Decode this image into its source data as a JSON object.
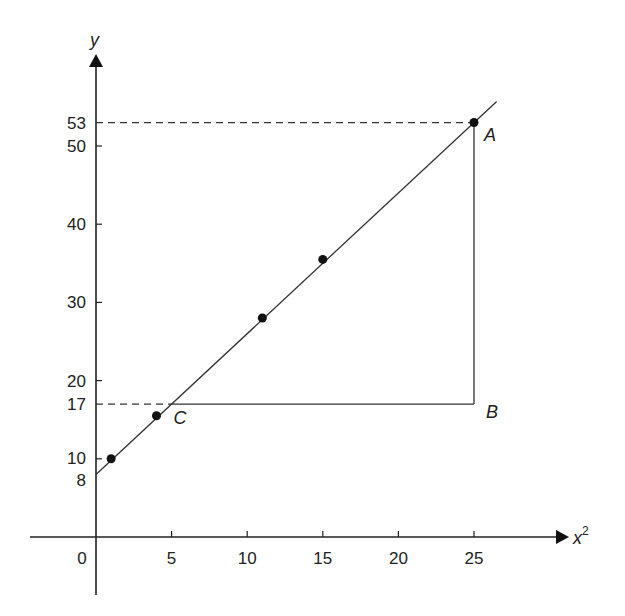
{
  "chart_data": {
    "type": "scatter",
    "title": "",
    "xlabel": "x²",
    "ylabel": "y",
    "xlim": [
      0,
      28
    ],
    "ylim": [
      0,
      60
    ],
    "x_ticks": [
      0,
      5,
      10,
      15,
      20,
      25
    ],
    "y_ticks": [
      8,
      10,
      17,
      20,
      30,
      40,
      50,
      53
    ],
    "points": [
      {
        "x": 1,
        "y": 10
      },
      {
        "x": 4,
        "y": 15.5
      },
      {
        "x": 11,
        "y": 28
      },
      {
        "x": 15,
        "y": 35.5
      },
      {
        "x": 25,
        "y": 53
      }
    ],
    "best_fit_line": {
      "intercept": 8,
      "slope": 1.8,
      "x_range": [
        0,
        26.5
      ]
    },
    "annotations": [
      {
        "label": "A",
        "x": 25,
        "y": 53
      },
      {
        "label": "B",
        "x": 25,
        "y": 17
      },
      {
        "label": "C",
        "x": 5,
        "y": 17
      }
    ],
    "dashed_guides": [
      {
        "from": [
          0,
          53
        ],
        "to": [
          25,
          53
        ]
      },
      {
        "from": [
          0,
          17
        ],
        "to": [
          5,
          17
        ]
      }
    ],
    "triangle": {
      "vertices": [
        "A",
        "B",
        "C"
      ]
    },
    "grid": false,
    "legend": null
  },
  "labels": {
    "x_axis": "x",
    "x_axis_sup": "2",
    "y_axis": "y",
    "origin": "0",
    "A": "A",
    "B": "B",
    "C": "C"
  }
}
